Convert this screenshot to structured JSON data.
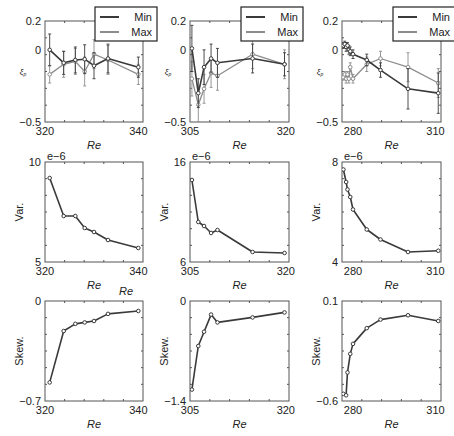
{
  "figure": {
    "legend": {
      "entries": [
        "Min",
        "Max"
      ]
    },
    "colors": {
      "min": "#3a3a3a",
      "max": "#8c8c8c",
      "frame": "#555555",
      "text": "#222222"
    }
  },
  "chart_data": [
    {
      "type": "line",
      "panel": "row1-col1",
      "xlabel": "Re",
      "ylabel": "ξ_p",
      "ylim": [
        -0.5,
        0.2
      ],
      "xlim": [
        320,
        341
      ],
      "yticks": [
        "0.2",
        "0",
        "-0.5"
      ],
      "xticks": [
        "320",
        "340"
      ],
      "legend": [
        "Min",
        "Max"
      ],
      "legend_position": "upper right",
      "error_bars": true,
      "series": [
        {
          "name": "Min",
          "x": [
            321,
            324,
            326.5,
            328.5,
            330.5,
            333.5,
            340
          ],
          "y": [
            0.0,
            -0.09,
            -0.07,
            -0.065,
            -0.11,
            -0.06,
            -0.12
          ],
          "err": [
            0.11,
            0.08,
            0.09,
            0.1,
            0.09,
            0.1,
            0.07
          ]
        },
        {
          "name": "Max",
          "x": [
            321,
            324,
            326.5,
            328.5,
            330.5,
            333.5,
            340
          ],
          "y": [
            -0.17,
            -0.1,
            -0.08,
            -0.15,
            -0.03,
            -0.07,
            -0.17
          ],
          "err": [
            0.06,
            0.09,
            0.09,
            0.1,
            0.1,
            0.1,
            0.07
          ]
        }
      ]
    },
    {
      "type": "line",
      "panel": "row1-col2",
      "xlabel": "Re",
      "ylabel": "ξ_p",
      "ylim": [
        -0.5,
        0.2
      ],
      "xlim": [
        305,
        320.5
      ],
      "yticks": [
        "0.2",
        "0",
        "-0.5"
      ],
      "xticks": [
        "305",
        "320"
      ],
      "legend": [
        "Min",
        "Max"
      ],
      "legend_position": "upper right",
      "error_bars": true,
      "series": [
        {
          "name": "Min",
          "x": [
            305.3,
            306.3,
            307.2,
            308.3,
            309.3,
            314.8,
            319.8
          ],
          "y": [
            0.01,
            -0.3,
            -0.12,
            -0.06,
            -0.09,
            -0.06,
            -0.1
          ],
          "err": [
            0.16,
            0.1,
            0.12,
            0.1,
            0.1,
            0.1,
            0.08
          ]
        },
        {
          "name": "Max",
          "x": [
            305.3,
            306.3,
            307.2,
            308.3,
            309.3,
            314.8,
            319.8
          ],
          "y": [
            -0.2,
            -0.38,
            -0.27,
            -0.16,
            -0.18,
            -0.03,
            -0.1
          ],
          "err": [
            0.12,
            0.12,
            0.1,
            0.1,
            0.1,
            0.1,
            0.1
          ]
        }
      ]
    },
    {
      "type": "line",
      "panel": "row1-col3",
      "xlabel": "Re",
      "ylabel": "ξ_p",
      "ylim": [
        -0.5,
        0.2
      ],
      "xlim": [
        276,
        312
      ],
      "yticks": [
        "0.2",
        "0",
        "-0.5"
      ],
      "xticks": [
        "280",
        "310"
      ],
      "legend": [
        "Min",
        "Max"
      ],
      "legend_position": "upper right",
      "error_bars": true,
      "series": [
        {
          "name": "Min",
          "x": [
            276.5,
            277,
            277.5,
            278,
            278.5,
            279,
            280,
            285,
            290,
            300,
            311
          ],
          "y": [
            0.03,
            0.04,
            0.02,
            0.03,
            0.0,
            -0.01,
            -0.03,
            -0.07,
            -0.14,
            -0.27,
            -0.3
          ],
          "err": [
            0.02,
            0.02,
            0.03,
            0.02,
            0.03,
            0.03,
            0.03,
            0.04,
            0.05,
            0.14,
            0.14
          ]
        },
        {
          "name": "Max",
          "x": [
            276.5,
            277,
            277.5,
            278,
            278.5,
            279,
            280,
            285,
            290,
            300,
            311
          ],
          "y": [
            -0.19,
            -0.17,
            -0.2,
            -0.17,
            -0.2,
            -0.12,
            -0.2,
            -0.1,
            -0.06,
            -0.12,
            -0.23
          ],
          "err": [
            0.02,
            0.02,
            0.03,
            0.02,
            0.03,
            0.03,
            0.03,
            0.05,
            0.05,
            0.1,
            0.1
          ]
        }
      ]
    },
    {
      "type": "line",
      "panel": "row2-col1",
      "xlabel": "Re",
      "ylabel": "Var.",
      "ylim": [
        5,
        10
      ],
      "xlim": [
        320,
        341
      ],
      "yticks": [
        "10",
        "5"
      ],
      "xticks": [
        "320",
        "340"
      ],
      "yscale_label": "e−6",
      "series": [
        {
          "name": "Var",
          "x": [
            321,
            324,
            326.5,
            328.5,
            330.5,
            333.5,
            340
          ],
          "y": [
            9.2,
            7.3,
            7.3,
            6.7,
            6.5,
            6.1,
            5.7
          ]
        }
      ]
    },
    {
      "type": "line",
      "panel": "row2-col2",
      "xlabel": "Re",
      "ylabel": "Var.",
      "ylim": [
        6,
        16
      ],
      "xlim": [
        305,
        320.5
      ],
      "yticks": [
        "16",
        "6"
      ],
      "xticks": [
        "305",
        "320"
      ],
      "yscale_label": "e−6",
      "series": [
        {
          "name": "Var",
          "x": [
            305.3,
            306.3,
            307.2,
            308.3,
            309.3,
            314.8,
            319.8
          ],
          "y": [
            14.2,
            10.0,
            9.6,
            8.9,
            9.2,
            7.0,
            6.9
          ]
        }
      ]
    },
    {
      "type": "line",
      "panel": "row2-col3",
      "xlabel": "Re",
      "ylabel": "Var.",
      "ylim": [
        4,
        8
      ],
      "xlim": [
        276,
        312
      ],
      "yticks": [
        "8",
        "4"
      ],
      "xticks": [
        "280",
        "310"
      ],
      "yscale_label": "e−6",
      "series": [
        {
          "name": "Var",
          "x": [
            276.5,
            277.5,
            278,
            279,
            280,
            285,
            290,
            300,
            311
          ],
          "y": [
            7.7,
            7.2,
            6.9,
            6.6,
            6.1,
            5.3,
            4.9,
            4.4,
            4.45
          ]
        }
      ]
    },
    {
      "type": "line",
      "panel": "row3-col1",
      "xlabel": "Re",
      "ylabel": "Skew.",
      "ylim": [
        -0.7,
        0
      ],
      "xlim": [
        320,
        341
      ],
      "yticks": [
        "0",
        "-0.7"
      ],
      "xticks": [
        "320",
        "340"
      ],
      "annotation": "Re",
      "series": [
        {
          "name": "Skew",
          "x": [
            321,
            324,
            326.5,
            328.5,
            330.5,
            333.5,
            340
          ],
          "y": [
            -0.57,
            -0.21,
            -0.16,
            -0.15,
            -0.14,
            -0.09,
            -0.07
          ]
        }
      ]
    },
    {
      "type": "line",
      "panel": "row3-col2",
      "xlabel": "Re",
      "ylabel": "Skew.",
      "ylim": [
        -1.4,
        0
      ],
      "xlim": [
        305,
        320.5
      ],
      "yticks": [
        "0",
        "-1.4"
      ],
      "xticks": [
        "305",
        "320"
      ],
      "series": [
        {
          "name": "Skew",
          "x": [
            305.3,
            306.3,
            307.2,
            308.3,
            309.3,
            314.8,
            319.8
          ],
          "y": [
            -1.24,
            -0.63,
            -0.43,
            -0.19,
            -0.3,
            -0.23,
            -0.16
          ]
        }
      ]
    },
    {
      "type": "line",
      "panel": "row3-col3",
      "xlabel": "Re",
      "ylabel": "Skew.",
      "ylim": [
        -0.6,
        0.1
      ],
      "xlim": [
        276,
        312
      ],
      "yticks": [
        "0.1",
        "-0.6"
      ],
      "xticks": [
        "280",
        "310"
      ],
      "series": [
        {
          "name": "Skew",
          "x": [
            276.5,
            277.5,
            278,
            279,
            280,
            285,
            290,
            300,
            311
          ],
          "y": [
            -0.55,
            -0.56,
            -0.4,
            -0.27,
            -0.2,
            -0.09,
            -0.03,
            0.0,
            -0.04
          ]
        }
      ]
    }
  ]
}
